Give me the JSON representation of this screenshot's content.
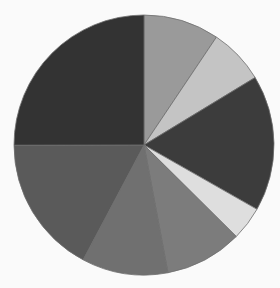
{
  "chart_data": {
    "type": "pie",
    "title": "",
    "legend": "none",
    "center": [
      144,
      145
    ],
    "radius": 130,
    "start_angle_deg": 0,
    "direction": "clockwise",
    "categories": [
      "Slice 1",
      "Slice 2",
      "Slice 3",
      "Slice 4",
      "Slice 5",
      "Slice 6",
      "Slice 7",
      "Slice 8"
    ],
    "values": [
      9.4,
      6.9,
      16.9,
      4.2,
      9.6,
      10.7,
      17.2,
      25.0
    ],
    "colors": [
      "#9a9a9a",
      "#c4c4c4",
      "#3c3c3c",
      "#dedede",
      "#7c7c7c",
      "#707070",
      "#5a5a5a",
      "#333333"
    ]
  }
}
